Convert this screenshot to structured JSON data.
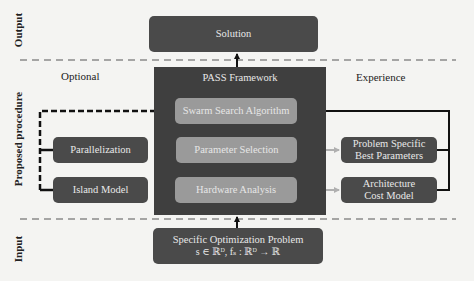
{
  "sections": {
    "output": "Output",
    "proposed": "Proposed procedure",
    "input": "Input"
  },
  "labels": {
    "optional": "Optional",
    "experience": "Experience"
  },
  "output_box": {
    "label": "Solution"
  },
  "framework": {
    "title": "PASS Framework",
    "steps": [
      {
        "label": "Swarm Search Algorithm"
      },
      {
        "label": "Parameter Selection"
      },
      {
        "label": "Hardware Analysis"
      }
    ]
  },
  "optional_boxes": [
    {
      "label": "Parallelization"
    },
    {
      "label": "Island Model"
    }
  ],
  "experience_boxes": [
    {
      "line1": "Problem Specific",
      "line2": "Best Parameters"
    },
    {
      "line1": "Architecture",
      "line2": "Cost Model"
    }
  ],
  "input_box": {
    "line1": "Specific Optimization Problem",
    "line2": "s ∈ ℝᴰ, fₛ : ℝᴰ → ℝ"
  },
  "colors": {
    "background": "#f4f4f2",
    "dark_box": "#4a4a4a",
    "framework_box": "#3f3f3f",
    "light_box": "#9a9a9a",
    "arrow_gray": "#a8a8a8",
    "line_black": "#111111"
  }
}
